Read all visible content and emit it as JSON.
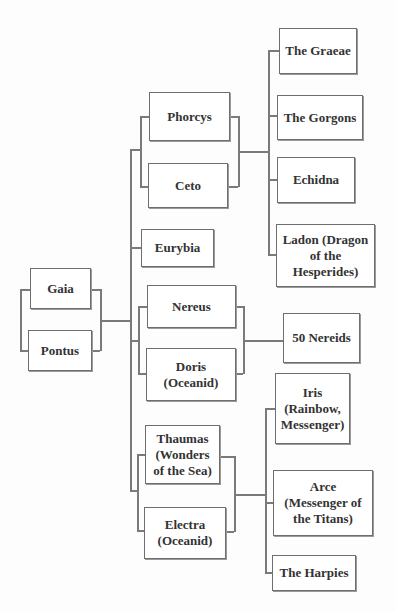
{
  "diagram": {
    "type": "family-tree",
    "parents": [
      {
        "id": "gaia",
        "label": "Gaia"
      },
      {
        "id": "pontus",
        "label": "Pontus"
      }
    ],
    "children": [
      {
        "id": "phorcys",
        "label": "Phorcys",
        "partner": "ceto"
      },
      {
        "id": "ceto",
        "label": "Ceto",
        "partner": "phorcys"
      },
      {
        "id": "eurybia",
        "label": "Eurybia"
      },
      {
        "id": "nereus",
        "label": "Nereus",
        "partner": "doris"
      },
      {
        "id": "doris",
        "label": "Doris (Oceanid)",
        "partner": "nereus"
      },
      {
        "id": "thaumas",
        "label": "Thaumas (Wonders of the Sea)",
        "partner": "electra"
      },
      {
        "id": "electra",
        "label": "Electra (Oceanid)",
        "partner": "thaumas"
      }
    ],
    "grandchildren": {
      "phorcys_ceto": [
        {
          "id": "graeae",
          "label": "The Graeae"
        },
        {
          "id": "gorgons",
          "label": "The Gorgons"
        },
        {
          "id": "echidna",
          "label": "Echidna"
        },
        {
          "id": "ladon",
          "label": "Ladon (Dragon of the Hesperides)"
        }
      ],
      "nereus_doris": [
        {
          "id": "nereids",
          "label": "50 Nereids"
        }
      ],
      "thaumas_electra": [
        {
          "id": "iris",
          "label": "Iris (Rainbow, Messenger)"
        },
        {
          "id": "arce",
          "label": "Arce (Messenger of the Titans)"
        },
        {
          "id": "harpies",
          "label": "The Harpies"
        }
      ]
    }
  },
  "labels": {
    "gaia": "Gaia",
    "pontus": "Pontus",
    "phorcys": "Phorcys",
    "ceto": "Ceto",
    "eurybia": "Eurybia",
    "nereus": "Nereus",
    "doris": "Doris (Oceanid)",
    "thaumas": "Thaumas (Wonders of the Sea)",
    "electra": "Electra (Oceanid)",
    "graeae": "The Graeae",
    "gorgons": "The Gorgons",
    "echidna": "Echidna",
    "ladon": "Ladon (Dragon of the Hesperides)",
    "nereids": "50 Nereids",
    "iris": "Iris (Rainbow, Messenger)",
    "arce": "Arce (Messenger of the Titans)",
    "harpies": "The Harpies"
  },
  "colors": {
    "line": "#7a7a7a",
    "box_border": "#6e6e6e",
    "text": "#333333",
    "background": "#fdfdfd"
  }
}
